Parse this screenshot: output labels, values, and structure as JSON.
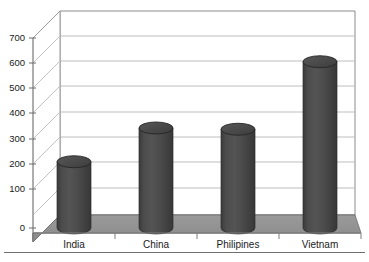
{
  "chart_data": {
    "type": "bar",
    "title": "",
    "subtitle": "",
    "xlabel": "",
    "ylabel": "",
    "categories": [
      "India",
      "China",
      "Philipines",
      "Vietnam"
    ],
    "values": [
      265,
      400,
      395,
      665
    ],
    "series": [
      {
        "name": "",
        "values": [
          265,
          400,
          395,
          665
        ]
      }
    ],
    "ylim": [
      0,
      700
    ],
    "yticks": [
      0,
      100,
      200,
      300,
      400,
      500,
      600,
      700
    ],
    "ytick_labels": [
      "0",
      "100",
      "200",
      "300",
      "400",
      "500",
      "600",
      "700"
    ],
    "grid": true,
    "grid_axis": "y",
    "legend": false,
    "legend_position": "none",
    "style": "3d-cylinder",
    "annotations": []
  },
  "colors": {
    "bar_front": "#4a4a4a",
    "bar_side_dark": "#3b3b3b",
    "bar_top": "#4f4f4f",
    "bar_top_edge": "#2e2e2e",
    "floor": "#909090",
    "floor_edge": "#6f6f6f",
    "back_wall": "#ffffff",
    "gridline": "#b9b9b9",
    "axis_line": "#8a8a8a",
    "tick_text": "#1a1a1a",
    "rule": "#6e6e6e",
    "page_background": "#ffffff"
  },
  "axes": {
    "y_axis_title": "",
    "x_axis_title": "",
    "y_tick_labels": [
      "700",
      "600",
      "500",
      "400",
      "300",
      "200",
      "100",
      "0"
    ],
    "x_tick_labels": [
      "India",
      "China",
      "Philipines",
      "Vietnam"
    ]
  },
  "figure": {
    "caption": "",
    "bottom_rule_visible": true
  }
}
